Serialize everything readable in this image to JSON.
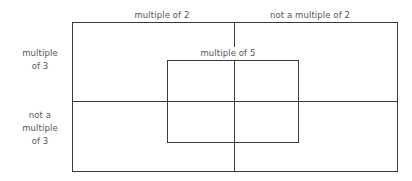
{
  "diagram": {
    "type": "carroll-diagram",
    "title": "",
    "background_color": "#ffffff",
    "line_color": "#3a3a3a",
    "text_color": "#555555",
    "column_headers": [
      {
        "id": "multiple-of-2",
        "label": "multiple of 2"
      },
      {
        "id": "not-a-multiple-of-2",
        "label": "not a multiple of 2"
      }
    ],
    "row_headers": [
      {
        "id": "multiple-of-3",
        "lines": [
          "multiple",
          "of 3"
        ],
        "label": "multiple of 3"
      },
      {
        "id": "not-a-multiple-of-3",
        "lines": [
          "not a",
          "multiple",
          "of 3"
        ],
        "label": "not a multiple of 3"
      }
    ],
    "overlay_set": {
      "id": "multiple-of-5",
      "label": "multiple of 5"
    },
    "cells": [
      {
        "id": "cell-m2-m3",
        "column": "multiple of 2",
        "row": "multiple of 3",
        "content": ""
      },
      {
        "id": "cell-n2-m3",
        "column": "not a multiple of 2",
        "row": "multiple of 3",
        "content": ""
      },
      {
        "id": "cell-m2-n3",
        "column": "multiple of 2",
        "row": "not a multiple of 3",
        "content": ""
      },
      {
        "id": "cell-n2-n3",
        "column": "not a multiple of 2",
        "row": "not a multiple of 3",
        "content": ""
      }
    ]
  }
}
